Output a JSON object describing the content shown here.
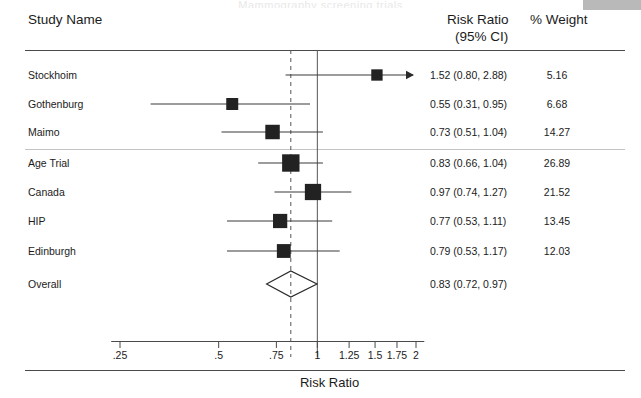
{
  "figure": {
    "corner_box_color": "#b9b9b9",
    "clipped_top_title": "Mammography screening trials"
  },
  "header": {
    "study_col": "Study Name",
    "estimate_col_line1": "Risk Ratio",
    "estimate_col_line2": "(95% CI)",
    "weight_col": "% Weight"
  },
  "axis": {
    "title": "Risk Ratio",
    "tick_labels": [
      ".25",
      ".5",
      ".75",
      "1",
      "1.25",
      "1.5",
      "1.75",
      "2"
    ],
    "tick_values": [
      0.25,
      0.5,
      0.75,
      1,
      1.25,
      1.5,
      1.75,
      2
    ],
    "scale": "log",
    "null_line_value": 1,
    "pooled_line_value": 0.83
  },
  "chart_data": {
    "type": "forest",
    "title": "",
    "xlabel": "Risk Ratio",
    "ylabel": "",
    "xscale": "log",
    "xlim": [
      0.22,
      2.15
    ],
    "xticks": [
      0.25,
      0.5,
      0.75,
      1,
      1.25,
      1.5,
      1.75,
      2
    ],
    "xticklabels": [
      ".25",
      ".5",
      ".75",
      "1",
      "1.25",
      "1.5",
      "1.75",
      "2"
    ],
    "grid": false,
    "legend": "none",
    "reference_line": 1,
    "pooled_reference_line": 0.83,
    "group_separator_after": "Maimo",
    "columns": [
      "Study Name",
      "Risk Ratio (95% CI)",
      "% Weight"
    ],
    "studies": [
      {
        "name": "Stockhoim",
        "est": 1.52,
        "lo": 0.8,
        "hi": 2.88,
        "weight": 5.16,
        "label": "1.52 (0.80, 2.88)",
        "weight_label": "5.16",
        "ci_truncated_right": true
      },
      {
        "name": "Gothenburg",
        "est": 0.55,
        "lo": 0.31,
        "hi": 0.95,
        "weight": 6.68,
        "label": "0.55 (0.31, 0.95)",
        "weight_label": "6.68",
        "ci_truncated_right": false
      },
      {
        "name": "Maimo",
        "est": 0.73,
        "lo": 0.51,
        "hi": 1.04,
        "weight": 14.27,
        "label": "0.73 (0.51, 1.04)",
        "weight_label": "14.27",
        "ci_truncated_right": false
      },
      {
        "name": "Age Trial",
        "est": 0.83,
        "lo": 0.66,
        "hi": 1.04,
        "weight": 26.89,
        "label": "0.83 (0.66, 1.04)",
        "weight_label": "26.89",
        "ci_truncated_right": false
      },
      {
        "name": "Canada",
        "est": 0.97,
        "lo": 0.74,
        "hi": 1.27,
        "weight": 21.52,
        "label": "0.97 (0.74, 1.27)",
        "weight_label": "21.52",
        "ci_truncated_right": false
      },
      {
        "name": "HIP",
        "est": 0.77,
        "lo": 0.53,
        "hi": 1.11,
        "weight": 13.45,
        "label": "0.77 (0.53, 1.11)",
        "weight_label": "13.45",
        "ci_truncated_right": false
      },
      {
        "name": "Edinburgh",
        "est": 0.79,
        "lo": 0.53,
        "hi": 1.17,
        "weight": 12.03,
        "label": "0.79 (0.53, 1.17)",
        "weight_label": "12.03",
        "ci_truncated_right": false
      }
    ],
    "overall": {
      "name": "Overall",
      "est": 0.83,
      "lo": 0.72,
      "hi": 0.97,
      "label": "0.83 (0.72, 0.97)",
      "weight_label": ""
    }
  }
}
